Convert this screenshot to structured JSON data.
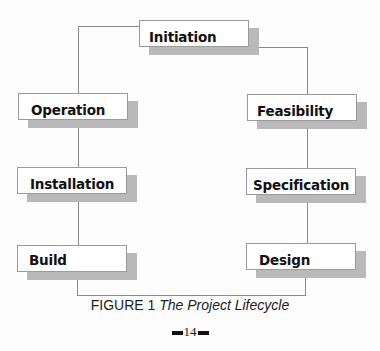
{
  "diagram": {
    "nodes": [
      {
        "id": "initiation",
        "label": "Initiation"
      },
      {
        "id": "feasibility",
        "label": "Feasibility"
      },
      {
        "id": "specification",
        "label": "Specification"
      },
      {
        "id": "design",
        "label": "Design"
      },
      {
        "id": "build",
        "label": "Build"
      },
      {
        "id": "installation",
        "label": "Installation"
      },
      {
        "id": "operation",
        "label": "Operation"
      }
    ],
    "edges": [
      [
        "initiation",
        "feasibility"
      ],
      [
        "feasibility",
        "specification"
      ],
      [
        "specification",
        "design"
      ],
      [
        "design",
        "build"
      ],
      [
        "build",
        "installation"
      ],
      [
        "installation",
        "operation"
      ],
      [
        "operation",
        "initiation"
      ]
    ]
  },
  "caption": {
    "prefix": "FIGURE 1",
    "title": "The Project Lifecycle"
  },
  "page": {
    "number": "14"
  }
}
